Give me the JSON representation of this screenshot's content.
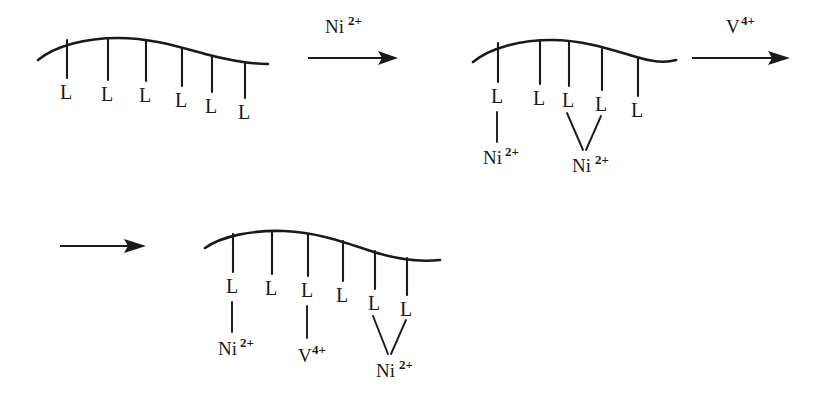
{
  "diagram": {
    "ligand_label": "L",
    "ink_color": "#1a1a1a",
    "background_color": "#ffffff",
    "steps": [
      {
        "id": "structure-1",
        "name": "polymer-with-free-ligands",
        "ligand_count": 6,
        "ligands": [
          "L",
          "L",
          "L",
          "L",
          "L",
          "L"
        ],
        "bound_metals": []
      },
      {
        "id": "arrow-1",
        "name": "reaction-arrow-ni",
        "reagent_symbol": "Ni",
        "reagent_charge": "2+"
      },
      {
        "id": "structure-2",
        "name": "polymer-with-nickel",
        "ligand_count": 5,
        "ligands": [
          "L",
          "L",
          "L",
          "L",
          "L"
        ],
        "bound_metals": [
          {
            "symbol": "Ni",
            "charge": "2+",
            "coordination": "monodentate",
            "ligand_indices": [
              1
            ]
          },
          {
            "symbol": "Ni",
            "charge": "2+",
            "coordination": "bidentate",
            "ligand_indices": [
              3,
              4
            ]
          }
        ]
      },
      {
        "id": "arrow-2",
        "name": "reaction-arrow-vanadium",
        "reagent_symbol": "V",
        "reagent_charge": "4+"
      },
      {
        "id": "arrow-3",
        "name": "reaction-arrow-continuation",
        "reagent_symbol": "",
        "reagent_charge": ""
      },
      {
        "id": "structure-3",
        "name": "polymer-with-nickel-and-vanadium",
        "ligand_count": 6,
        "ligands": [
          "L",
          "L",
          "L",
          "L",
          "L",
          "L"
        ],
        "bound_metals": [
          {
            "symbol": "Ni",
            "charge": "2+",
            "coordination": "monodentate",
            "ligand_indices": [
              1
            ]
          },
          {
            "symbol": "V",
            "charge": "4+",
            "coordination": "monodentate",
            "ligand_indices": [
              3
            ]
          },
          {
            "symbol": "Ni",
            "charge": "2+",
            "coordination": "bidentate",
            "ligand_indices": [
              5,
              6
            ]
          }
        ]
      }
    ]
  },
  "labels": {
    "s1_L1": "L",
    "s1_L2": "L",
    "s1_L3": "L",
    "s1_L4": "L",
    "s1_L5": "L",
    "s1_L6": "L",
    "s2_L1": "L",
    "s2_L2": "L",
    "s2_L3": "L",
    "s2_L4": "L",
    "s2_L5": "L",
    "s3_L1": "L",
    "s3_L2": "L",
    "s3_L3": "L",
    "s3_L4": "L",
    "s3_L5": "L",
    "s3_L6": "L",
    "arrow1_el": "Ni",
    "arrow1_sup": "2+",
    "arrow2_el": "V",
    "arrow2_sup": "4+",
    "s2_m1_el": "Ni",
    "s2_m1_sup": "2+",
    "s2_m2_el": "Ni",
    "s2_m2_sup": "2+",
    "s3_m1_el": "Ni",
    "s3_m1_sup": "2+",
    "s3_m2_el": "V",
    "s3_m2_sup": "4+",
    "s3_m3_el": "Ni",
    "s3_m3_sup": "2+"
  }
}
